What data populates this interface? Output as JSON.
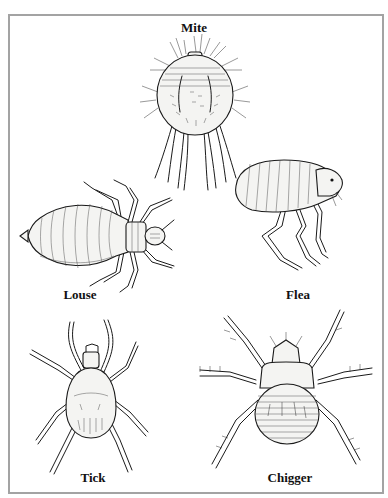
{
  "figure": {
    "frame_border_color": "#a3a3a3",
    "label_color": "#111111",
    "organisms": [
      {
        "id": "mite",
        "label": "Mite"
      },
      {
        "id": "louse",
        "label": "Louse"
      },
      {
        "id": "flea",
        "label": "Flea"
      },
      {
        "id": "tick",
        "label": "Tick"
      },
      {
        "id": "chigger",
        "label": "Chigger"
      }
    ]
  }
}
